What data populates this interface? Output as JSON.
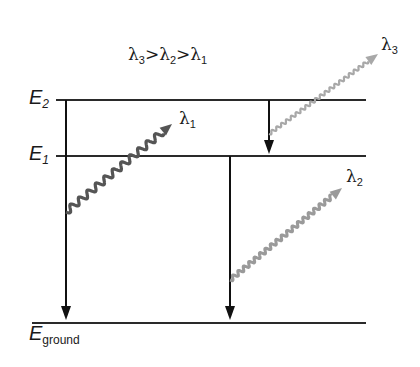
{
  "diagram": {
    "condition": {
      "parts": [
        "λ",
        "3",
        ">λ",
        "2",
        ">λ",
        "1"
      ]
    },
    "levels": [
      {
        "id": "E2",
        "base": "E",
        "sub": "2",
        "y": 100
      },
      {
        "id": "E1",
        "base": "E",
        "sub": "1",
        "y": 156
      },
      {
        "id": "Eground",
        "base": "E",
        "sub": "ground",
        "y": 323
      }
    ],
    "transitions": [
      {
        "from": "E2",
        "to": "Eground",
        "x": 66
      },
      {
        "from": "E2",
        "to": "E1",
        "x": 269
      },
      {
        "from": "E1",
        "to": "Eground",
        "x": 230
      }
    ],
    "photons": [
      {
        "label": "λ",
        "sub": "1",
        "color": "#555555",
        "start": [
          66,
          212
        ],
        "end": [
          172,
          124
        ]
      },
      {
        "label": "λ",
        "sub": "3",
        "color": "#a8a8a8",
        "start": [
          269,
          134
        ],
        "end": [
          378,
          54
        ]
      },
      {
        "label": "λ",
        "sub": "2",
        "color": "#9a9a9a",
        "start": [
          230,
          280
        ],
        "end": [
          342,
          188
        ]
      }
    ],
    "colors": {
      "level_line": "#2a2a2a",
      "arrow": "#111111"
    }
  }
}
